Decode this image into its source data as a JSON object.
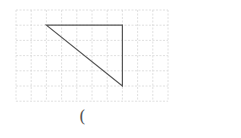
{
  "diagram": {
    "type": "grid-figure",
    "grid": {
      "origin_px": [
        16,
        10
      ],
      "cell_px": 15.2,
      "columns": 10,
      "rows": 6,
      "line_color": "#d8d8d8",
      "line_style": "dashed"
    },
    "shape": {
      "kind": "right-triangle",
      "vertices_grid": [
        [
          2,
          1
        ],
        [
          7,
          1
        ],
        [
          7,
          5
        ]
      ],
      "stroke_color": "#555555"
    },
    "answer_blank": {
      "text": "("
    }
  }
}
